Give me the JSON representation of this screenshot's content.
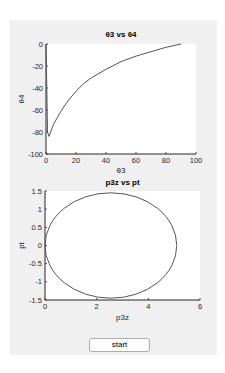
{
  "button": {
    "start_label": "start"
  },
  "chart_data": [
    {
      "type": "line",
      "title": "θ3 vs θ4",
      "xlabel": "θ3",
      "ylabel": "θ4",
      "xlim": [
        0,
        100
      ],
      "ylim": [
        -100,
        0
      ],
      "xticks": [
        "0",
        "20",
        "40",
        "60",
        "80",
        "100"
      ],
      "yticks": [
        "0",
        "-20",
        "-40",
        "-60",
        "-80",
        "-100"
      ],
      "grid": false,
      "series": [
        {
          "name": "θ4",
          "x": [
            0,
            0.5,
            1,
            2,
            5,
            10,
            15,
            20,
            25,
            30,
            40,
            50,
            60,
            70,
            80,
            90
          ],
          "y": [
            0,
            -40,
            -80,
            -84,
            -73,
            -61,
            -51,
            -43,
            -36,
            -31,
            -23,
            -16,
            -11,
            -7,
            -3,
            0
          ]
        }
      ]
    },
    {
      "type": "line",
      "title": "p3z vs pt",
      "xlabel": "p3z",
      "ylabel": "pt",
      "xlim": [
        0,
        6
      ],
      "ylim": [
        -1.5,
        1.5
      ],
      "xticks": [
        "0",
        "2",
        "4",
        "6"
      ],
      "yticks": [
        "1.5",
        "1",
        "0.5",
        "0",
        "-0.5",
        "-1",
        "-1.5"
      ],
      "grid": false,
      "series": [
        {
          "name": "ellipse",
          "center": [
            2.55,
            0
          ],
          "rx": 2.55,
          "ry": 1.45
        }
      ]
    }
  ]
}
